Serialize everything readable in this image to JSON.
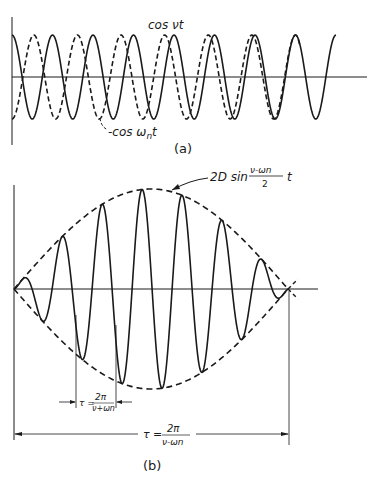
{
  "figure": {
    "panel_a": {
      "caption": "(a)",
      "curve_solid_label": "cos νt",
      "curve_dashed_label": "-cos ωnt",
      "curve_dashed_label_prefix": "-cos ω",
      "curve_dashed_label_sub": "n",
      "curve_dashed_label_suffix": "t"
    },
    "panel_b": {
      "caption": "(b)",
      "envelope_label_prefix": "2D sin",
      "envelope_frac_num": "ν-ωn",
      "envelope_frac_den": "2",
      "envelope_label_suffix": "t",
      "short_period_label": "τ =",
      "short_period_num": "2π",
      "short_period_den": "ν+ωn",
      "long_period_label": "τ =",
      "long_period_num": "2π",
      "long_period_den": "ν-ωn"
    }
  },
  "colors": {
    "ink": "#1a1a1a",
    "background": "#ffffff"
  }
}
